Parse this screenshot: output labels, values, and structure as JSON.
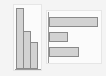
{
  "chart_data": [
    {
      "type": "bar",
      "orientation": "vertical",
      "title": "",
      "xlabel": "",
      "ylabel": "",
      "categories": [
        "A",
        "B",
        "C"
      ],
      "values": [
        100,
        62,
        45
      ],
      "ylim": [
        0,
        100
      ],
      "grid": false,
      "legend": null,
      "colors": {
        "fill": "#d2d2d2",
        "stroke": "#8a8a8a"
      }
    },
    {
      "type": "bar",
      "orientation": "horizontal",
      "title": "",
      "xlabel": "",
      "ylabel": "",
      "categories": [
        "A",
        "B",
        "C"
      ],
      "values": [
        100,
        39,
        61
      ],
      "xlim": [
        0,
        100
      ],
      "grid": false,
      "legend": null,
      "colors": {
        "fill": "#d2d2d2",
        "stroke": "#8a8a8a"
      }
    }
  ]
}
